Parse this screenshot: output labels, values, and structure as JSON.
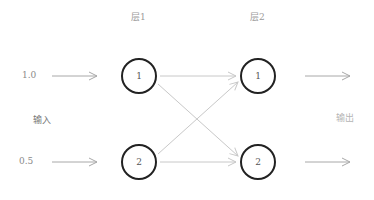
{
  "layers": [
    {
      "label": "层1",
      "nodes": [
        {
          "label": "1"
        },
        {
          "label": "2"
        }
      ]
    },
    {
      "label": "层2",
      "nodes": [
        {
          "label": "1"
        },
        {
          "label": "2"
        }
      ]
    }
  ],
  "input": {
    "label": "输入",
    "values": [
      "1.0",
      "0.5"
    ]
  },
  "output": {
    "label": "输出"
  },
  "colors": {
    "node_stroke": "#222222",
    "arrow": "#b0b0b0",
    "connection": "#c8c8c8",
    "label": "#9a9a9a"
  }
}
